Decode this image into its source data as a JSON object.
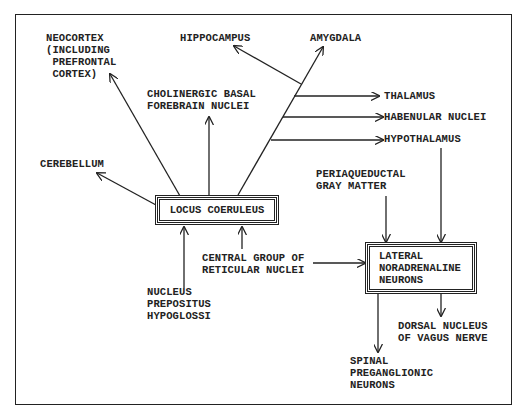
{
  "diagram": {
    "nodes": {
      "locus_coeruleus": "LOCUS COERULEUS",
      "lateral_noradrenaline": "LATERAL\nNORADRENALINE\nNEURONS",
      "neocortex": "NEOCORTEX\n(INCLUDING\n PREFRONTAL\n CORTEX)",
      "hippocampus": "HIPPOCAMPUS",
      "amygdala": "AMYGDALA",
      "cholinergic": "CHOLINERGIC BASAL\nFOREBRAIN NUCLEI",
      "thalamus": "THALAMUS",
      "habenular": "HABENULAR NUCLEI",
      "hypothalamus": "HYPOTHALAMUS",
      "cerebellum": "CEREBELLUM",
      "periaqueductal": "PERIAQUEDUCTAL\nGRAY MATTER",
      "central_group": "CENTRAL GROUP OF\nRETICULAR NUCLEI",
      "nucleus_prepositus": "NUCLEUS\nPREPOSITUS\nHYPOGLOSSI",
      "dorsal_vagus": "DORSAL NUCLEUS\nOF VAGUS NERVE",
      "spinal": "SPINAL\nPREGANGLIONIC\nNEURONS"
    },
    "edges": [
      {
        "from": "LOCUS COERULEUS",
        "to": "NEOCORTEX (INCLUDING PREFRONTAL CORTEX)"
      },
      {
        "from": "LOCUS COERULEUS",
        "to": "CHOLINERGIC BASAL FOREBRAIN NUCLEI"
      },
      {
        "from": "LOCUS COERULEUS",
        "to": "AMYGDALA"
      },
      {
        "from": "LOCUS COERULEUS",
        "to": "HIPPOCAMPUS"
      },
      {
        "from": "LOCUS COERULEUS",
        "to": "THALAMUS"
      },
      {
        "from": "LOCUS COERULEUS",
        "to": "HABENULAR NUCLEI"
      },
      {
        "from": "LOCUS COERULEUS",
        "to": "HYPOTHALAMUS"
      },
      {
        "from": "LOCUS COERULEUS",
        "to": "CEREBELLUM"
      },
      {
        "from": "NUCLEUS PREPOSITUS HYPOGLOSSI",
        "to": "LOCUS COERULEUS"
      },
      {
        "from": "CENTRAL GROUP OF RETICULAR NUCLEI",
        "to": "LOCUS COERULEUS"
      },
      {
        "from": "CENTRAL GROUP OF RETICULAR NUCLEI",
        "to": "LATERAL NORADRENALINE NEURONS"
      },
      {
        "from": "PERIAQUEDUCTAL GRAY MATTER",
        "to": "LATERAL NORADRENALINE NEURONS"
      },
      {
        "from": "HYPOTHALAMUS",
        "to": "LATERAL NORADRENALINE NEURONS"
      },
      {
        "from": "LATERAL NORADRENALINE NEURONS",
        "to": "SPINAL PREGANGLIONIC NEURONS"
      },
      {
        "from": "LATERAL NORADRENALINE NEURONS",
        "to": "DORSAL NUCLEUS OF VAGUS NERVE"
      }
    ]
  }
}
